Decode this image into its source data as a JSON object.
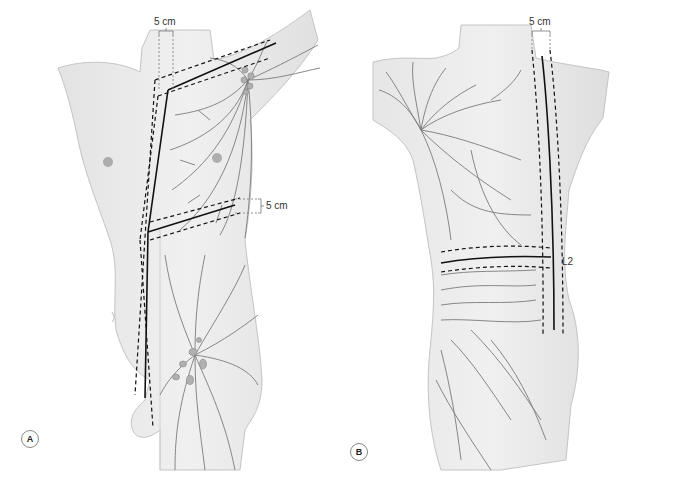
{
  "figure": {
    "colors": {
      "skin": "#ececec",
      "skin_shadow": "#d6d6d6",
      "outline": "#bdbdbd",
      "lymph": "#7a7a7a",
      "node": "#a9a9a9",
      "boundary": "#111111",
      "dim_line": "#777777"
    },
    "panels": [
      {
        "id": "A",
        "badge": "A",
        "view": "anterior",
        "labels": {
          "neck_width": "5 cm",
          "waist_width": "5 cm"
        }
      },
      {
        "id": "B",
        "badge": "B",
        "view": "posterior",
        "labels": {
          "neck_width": "5 cm",
          "level": "L2"
        }
      }
    ]
  }
}
